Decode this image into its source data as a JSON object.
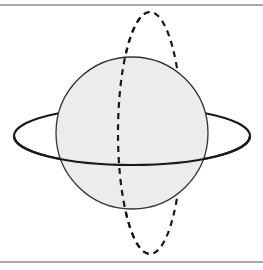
{
  "diagram": {
    "colors": {
      "background": "#ffffff",
      "rule": "#a8a8a8",
      "sphere_fill": "#ececec",
      "sphere_stroke": "#333333",
      "ring_stroke": "#1a1a1a",
      "dashed_stroke": "#1a1a1a"
    },
    "sphere": {
      "cx": 132,
      "cy": 133,
      "r": 76
    },
    "solid_ring": {
      "cx": 132,
      "cy": 136,
      "rx": 118,
      "ry": 29,
      "style": "solid"
    },
    "dashed_ring": {
      "cx": 150,
      "cy": 133,
      "rx": 32,
      "ry": 121,
      "style": "dashed"
    }
  }
}
